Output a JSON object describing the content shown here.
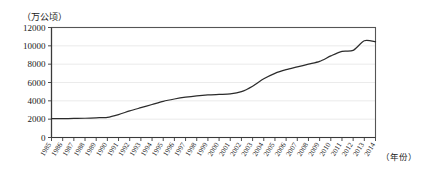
{
  "chart_data": {
    "type": "line",
    "title": "",
    "subtitle": "",
    "ylabel": "（万公顷）",
    "xlabel": "（年份）",
    "ylim": [
      0,
      12000
    ],
    "y_ticks": [
      0,
      2000,
      4000,
      6000,
      8000,
      10000,
      12000
    ],
    "y_tick_labels": [
      "0",
      "2000",
      "4000",
      "6000",
      "8000",
      "10000",
      "12000"
    ],
    "grid": true,
    "legend": "none",
    "categories": [
      "1985",
      "1986",
      "1987",
      "1988",
      "1989",
      "1990",
      "1991",
      "1992",
      "1993",
      "1994",
      "1995",
      "1996",
      "1997",
      "1998",
      "1999",
      "2000",
      "2001",
      "2002",
      "2003",
      "2004",
      "2005",
      "2006",
      "2007",
      "2008",
      "2009",
      "2010",
      "2011",
      "2012",
      "2013",
      "2014"
    ],
    "values": [
      2050,
      2060,
      2080,
      2100,
      2150,
      2200,
      2500,
      2900,
      3250,
      3600,
      3950,
      4200,
      4400,
      4550,
      4650,
      4700,
      4750,
      5000,
      5600,
      6400,
      7000,
      7400,
      7700,
      8000,
      8300,
      8900,
      9400,
      9500,
      10550,
      10450
    ],
    "series_name": "面积"
  },
  "axis": {
    "unit_note": "（万公顷）",
    "year_note": "（年份）"
  }
}
